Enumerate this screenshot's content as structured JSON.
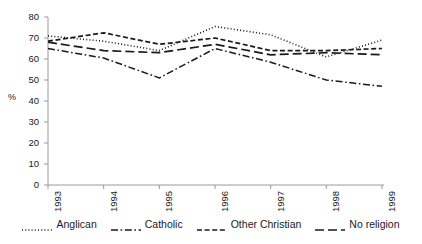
{
  "chart_data": {
    "type": "line",
    "title": "",
    "xlabel": "",
    "ylabel": "%",
    "categories": [
      "1993",
      "1994",
      "1995",
      "1996",
      "1997",
      "1998",
      "1999"
    ],
    "ylim": [
      0,
      80
    ],
    "yticks": [
      0,
      10,
      20,
      30,
      40,
      50,
      60,
      70,
      80
    ],
    "grid": false,
    "legend_position": "bottom",
    "series": [
      {
        "name": "Anglican",
        "style": "dotted",
        "color": "#1a1a1a",
        "values": [
          71,
          68.5,
          64,
          75.5,
          71.5,
          61,
          69
        ]
      },
      {
        "name": "Catholic",
        "style": "dash-dot",
        "color": "#1a1a1a",
        "values": [
          65,
          60.5,
          51,
          65,
          58.5,
          50,
          47
        ]
      },
      {
        "name": "Other Christian",
        "style": "short-dash",
        "color": "#1a1a1a",
        "values": [
          68.5,
          72.5,
          67,
          70,
          64,
          64,
          65
        ]
      },
      {
        "name": "No religion",
        "style": "long-dash",
        "color": "#1a1a1a",
        "values": [
          68,
          64,
          63,
          67,
          62,
          63,
          62
        ]
      }
    ]
  }
}
